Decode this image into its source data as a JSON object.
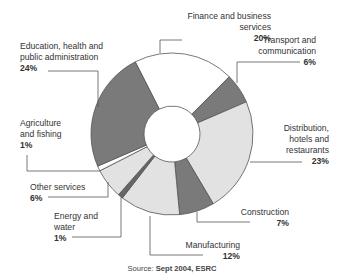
{
  "chart_data": {
    "type": "pie",
    "subtype": "donut",
    "title": "",
    "categories": [
      "Finance and business services",
      "Transport and communication",
      "Distribution, hotels and restaurants",
      "Construction",
      "Manufacturing",
      "Energy and water",
      "Other services",
      "Agriculture and fishing",
      "Education, health and public administration"
    ],
    "values": [
      20,
      6,
      23,
      7,
      12,
      1,
      6,
      1,
      24
    ],
    "unit": "%",
    "colors": [
      "#ffffff",
      "#7a7a7a",
      "#e2e2e2",
      "#7a7a7a",
      "#e2e2e2",
      "#666666",
      "#e2e2e2",
      "#ffffff",
      "#7a7a7a"
    ],
    "start_angle_deg": -27,
    "direction": "clockwise",
    "source": "Sept 2004, ESRC"
  },
  "labels": {
    "finance": {
      "line1": "Finance and business",
      "line2": "services",
      "pct": "20%"
    },
    "transport": {
      "line1": "Transport and",
      "line2": "communication",
      "pct": "6%"
    },
    "distribution": {
      "line1": "Distribution,",
      "line2": "hotels and",
      "line3": "restaurants",
      "pct": "23%"
    },
    "construction": {
      "line1": "Construction",
      "pct": "7%"
    },
    "manufacturing": {
      "line1": "Manufacturing",
      "pct": "12%"
    },
    "energy": {
      "line1": "Energy and",
      "line2": "water",
      "pct": "1%"
    },
    "other": {
      "line1": "Other services",
      "pct": "6%"
    },
    "agriculture": {
      "line1": "Agriculture",
      "line2": "and fishing",
      "pct": "1%"
    },
    "education": {
      "line1": "Education, health and",
      "line2": "public administration",
      "pct": "24%"
    }
  },
  "source": {
    "prefix": "Source: ",
    "value": "Sept 2004, ESRC"
  }
}
